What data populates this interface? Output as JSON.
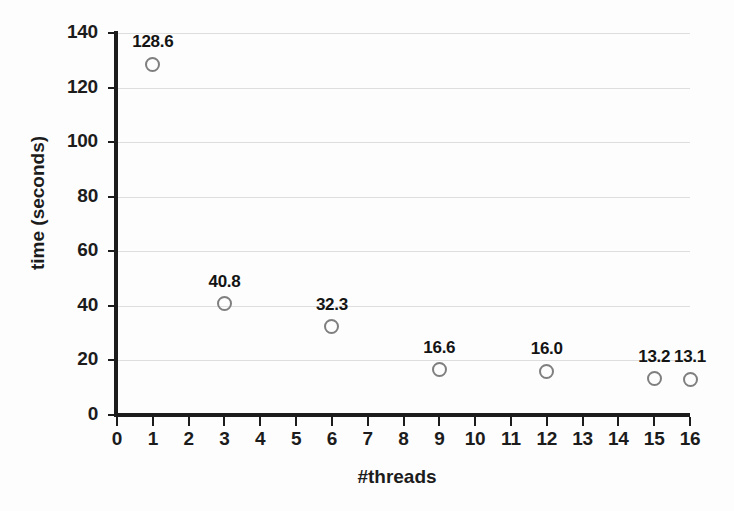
{
  "chart_data": {
    "type": "scatter",
    "title": "",
    "xlabel": "#threads",
    "ylabel": "time (seconds)",
    "xlim": [
      0,
      16
    ],
    "ylim": [
      0,
      140
    ],
    "xticks": [
      0,
      1,
      2,
      3,
      4,
      5,
      6,
      7,
      8,
      9,
      10,
      11,
      12,
      13,
      14,
      15,
      16
    ],
    "yticks": [
      0,
      20,
      40,
      60,
      80,
      100,
      120,
      140
    ],
    "grid": "horizontal",
    "legend": "none",
    "marker_style": "open-circle",
    "marker_color": "#7f7f7f",
    "x": [
      1,
      3,
      6,
      9,
      12,
      15,
      16
    ],
    "y": [
      128.6,
      40.8,
      32.3,
      16.6,
      16.0,
      13.2,
      13.1
    ],
    "point_labels": [
      "128.6",
      "40.8",
      "32.3",
      "16.6",
      "16.0",
      "13.2",
      "13.1"
    ],
    "points": [
      {
        "x": 1,
        "y": 128.6,
        "label": "128.6"
      },
      {
        "x": 3,
        "y": 40.8,
        "label": "40.8"
      },
      {
        "x": 6,
        "y": 32.3,
        "label": "32.3"
      },
      {
        "x": 9,
        "y": 16.6,
        "label": "16.6"
      },
      {
        "x": 12,
        "y": 16.0,
        "label": "16.0"
      },
      {
        "x": 15,
        "y": 13.2,
        "label": "13.2"
      },
      {
        "x": 16,
        "y": 13.1,
        "label": "13.1"
      }
    ]
  },
  "colors": {
    "marker": "#7f7f7f",
    "axis": "#1c1c1c",
    "grid": "#dedede",
    "text": "#141414",
    "background": "#fdfdfd"
  }
}
